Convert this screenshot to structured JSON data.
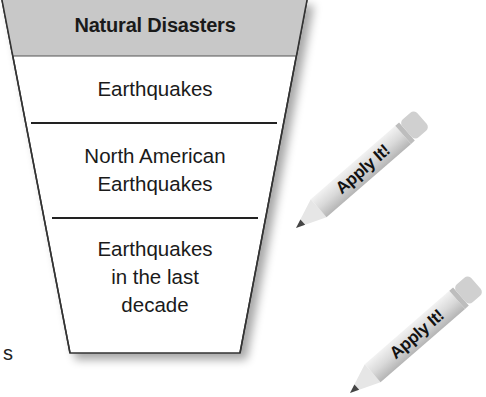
{
  "funnel": {
    "title": "Natural Disasters",
    "levels": [
      {
        "lines": [
          "Earthquakes"
        ]
      },
      {
        "lines": [
          "North American",
          "Earthquakes"
        ]
      },
      {
        "lines": [
          "Earthquakes",
          "in the last",
          "decade"
        ]
      }
    ],
    "header_color": "#c8c8c8",
    "border_color": "#333333"
  },
  "margin_text": "s",
  "pencils": [
    {
      "label": "Apply It!",
      "icon": "pencil-icon"
    },
    {
      "label": "Apply It!",
      "icon": "pencil-icon"
    }
  ]
}
